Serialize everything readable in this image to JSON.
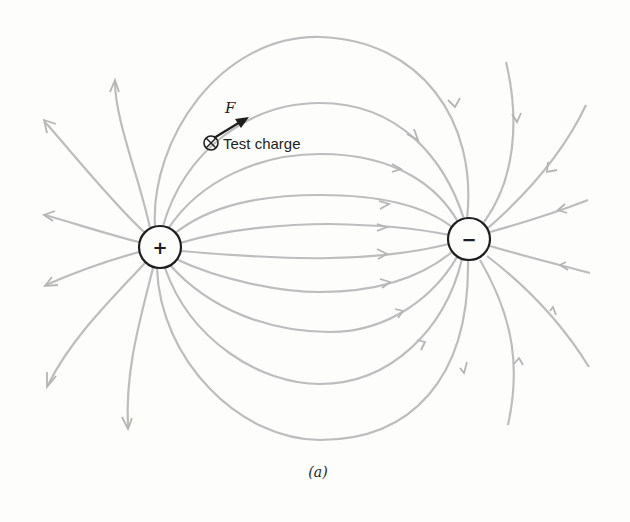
{
  "figure": {
    "caption": "(a)",
    "positive_charge": {
      "sign": "+",
      "cx": 160,
      "cy": 247,
      "r": 21
    },
    "negative_charge": {
      "sign": "−",
      "cx": 469,
      "cy": 239,
      "r": 21
    },
    "test_charge": {
      "symbol": "⊗",
      "label": "Test charge",
      "force_label": "F"
    },
    "colors": {
      "field_line": "#bdbdbd",
      "charge_outline": "#1e1e1e",
      "background": "#fdfdfc"
    }
  }
}
